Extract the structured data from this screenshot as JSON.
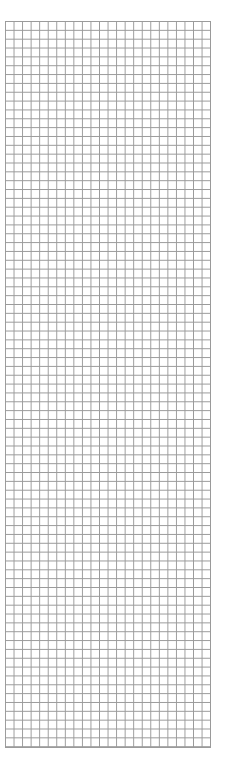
{
  "chart_data": {
    "type": "heatmap",
    "title": "",
    "columns": 24,
    "rows": 82,
    "column_labels": [
      "1",
      "2",
      "3",
      "4",
      "5",
      "6",
      "7",
      "8",
      "9",
      "10",
      "11",
      "12",
      "13",
      "14",
      "15",
      "16",
      "17",
      "18",
      "19",
      "20",
      "21",
      "22",
      "23",
      "24"
    ],
    "row_marker": {
      "label": "1",
      "symbol": "←",
      "row": 76
    },
    "border_rows": {
      "top": 2,
      "bottom": 2
    },
    "dots_by_row": {
      "2": [
        22
      ],
      "4": [
        1,
        7,
        21,
        23
      ],
      "6": [
        2,
        6,
        8,
        20,
        22,
        24
      ],
      "8": [
        1,
        5,
        7,
        9,
        21,
        23
      ],
      "10": [
        6,
        8,
        10,
        22,
        24
      ],
      "12": [
        5,
        7,
        9,
        11
      ],
      "14": [
        4,
        6,
        8,
        10
      ],
      "16": [
        5,
        7,
        9,
        15,
        17
      ],
      "18": [
        4,
        6,
        8,
        14,
        16,
        18
      ],
      "20": [
        3,
        5,
        7,
        13,
        15,
        17
      ],
      "22": [
        4,
        6,
        12,
        14,
        16
      ],
      "24": [
        3,
        5,
        13,
        15
      ],
      "26": [
        4,
        6,
        14
      ],
      "28": [
        5,
        13,
        15,
        23
      ],
      "30": [
        24
      ],
      "32": [
        1,
        23
      ],
      "34": [
        2,
        22,
        24
      ],
      "36": [
        1,
        3,
        21,
        23
      ],
      "38": [
        2,
        22,
        24
      ],
      "40": [
        1,
        13,
        23
      ],
      "42": [
        12,
        14,
        24
      ],
      "44": [
        11,
        13,
        15
      ],
      "46": [
        10,
        12,
        14,
        16
      ],
      "48": [
        9,
        11,
        13,
        15
      ],
      "50": [
        8,
        10,
        12,
        14,
        16
      ],
      "52": [
        7,
        9,
        11,
        13,
        15,
        17
      ],
      "54": [
        6,
        8,
        10,
        12,
        14,
        16
      ],
      "56": [
        9,
        11,
        13,
        15
      ],
      "58": [
        10,
        12,
        14
      ],
      "60": [
        1,
        11,
        13,
        15
      ],
      "62": [
        2,
        12,
        14,
        24
      ],
      "64": [
        1,
        3,
        13,
        23
      ],
      "66": [
        2,
        4,
        12,
        22,
        24
      ],
      "68": [
        1,
        3,
        5,
        21,
        23
      ],
      "70": [
        2,
        4,
        16,
        22,
        24
      ],
      "72": [
        1,
        3,
        15,
        17,
        23
      ],
      "74": [
        2,
        4,
        14,
        16,
        18,
        22,
        24
      ],
      "76": [
        1,
        3,
        5,
        15,
        17,
        23
      ],
      "78": [
        2,
        4,
        6,
        16,
        24
      ],
      "80": [
        1,
        3,
        5
      ],
      "82": [
        2,
        4,
        24
      ]
    },
    "colors": {
      "dot": "#0a0a0a",
      "grid": "#9a9a9a",
      "label": "#777777"
    }
  }
}
